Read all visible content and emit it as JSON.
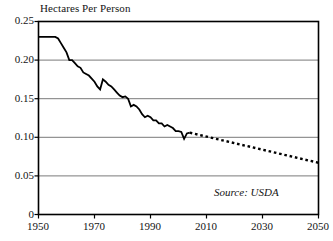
{
  "chart_data": {
    "type": "line",
    "title": "Hectares Per Person",
    "xlabel": "",
    "ylabel": "Hectares Per Person",
    "xlim": [
      1950,
      2050
    ],
    "ylim": [
      0,
      0.25
    ],
    "grid": true,
    "legend": false,
    "annotations": [
      {
        "text": "Source: USDA",
        "position": "bottom-right",
        "style": "italic"
      }
    ],
    "y_ticks": [
      "0",
      "0.05",
      "0.10",
      "0.15",
      "0.20",
      "0.25"
    ],
    "y_tick_values": [
      0,
      0.05,
      0.1,
      0.15,
      0.2,
      0.25
    ],
    "x_ticks": [
      "1950",
      "1970",
      "1990",
      "2010",
      "2030",
      "2050"
    ],
    "x_tick_values": [
      1950,
      1970,
      1990,
      2010,
      2030,
      2050
    ],
    "series": [
      {
        "name": "Grain Area Per Person (historical)",
        "style": "solid",
        "color": "#000000",
        "x": [
          1950,
          1951,
          1952,
          1953,
          1954,
          1955,
          1956,
          1957,
          1958,
          1959,
          1960,
          1961,
          1962,
          1963,
          1964,
          1965,
          1966,
          1967,
          1968,
          1969,
          1970,
          1971,
          1972,
          1973,
          1974,
          1975,
          1976,
          1977,
          1978,
          1979,
          1980,
          1981,
          1982,
          1983,
          1984,
          1985,
          1986,
          1987,
          1988,
          1989,
          1990,
          1991,
          1992,
          1993,
          1994,
          1995,
          1996,
          1997,
          1998,
          1999,
          2000,
          2001,
          2002,
          2003,
          2004
        ],
        "values": [
          0.23,
          0.23,
          0.23,
          0.23,
          0.23,
          0.23,
          0.23,
          0.228,
          0.222,
          0.216,
          0.21,
          0.2,
          0.2,
          0.196,
          0.192,
          0.19,
          0.184,
          0.182,
          0.18,
          0.176,
          0.172,
          0.166,
          0.162,
          0.175,
          0.172,
          0.168,
          0.166,
          0.162,
          0.158,
          0.154,
          0.152,
          0.153,
          0.15,
          0.14,
          0.142,
          0.14,
          0.136,
          0.13,
          0.126,
          0.128,
          0.126,
          0.122,
          0.122,
          0.118,
          0.118,
          0.114,
          0.116,
          0.114,
          0.112,
          0.108,
          0.108,
          0.107,
          0.098,
          0.105,
          0.106
        ]
      },
      {
        "name": "Projection",
        "style": "dotted",
        "color": "#000000",
        "x": [
          2004,
          2050
        ],
        "values": [
          0.106,
          0.067
        ]
      }
    ]
  }
}
